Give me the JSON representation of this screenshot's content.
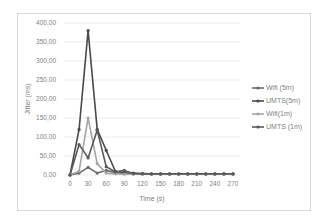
{
  "chart_data": {
    "type": "line",
    "title": "",
    "xlabel": "Time (s)",
    "ylabel": "Jitter (ms)",
    "ylim": [
      0,
      400
    ],
    "xlim": [
      0,
      270
    ],
    "grid": true,
    "legend_position": "right",
    "y_ticks": [
      "0,00",
      "50,00",
      "100,00",
      "150,00",
      "200,00",
      "250,00",
      "300,00",
      "350,00",
      "400,00"
    ],
    "x_ticks": [
      "0",
      "30",
      "60",
      "90",
      "120",
      "150",
      "180",
      "210",
      "240",
      "270"
    ],
    "x": [
      0,
      15,
      30,
      45,
      60,
      75,
      90,
      105,
      120,
      135,
      150,
      165,
      180,
      195,
      210,
      225,
      240,
      255,
      270
    ],
    "series": [
      {
        "name": "Wifi (5m)",
        "color": "#6b6b6b",
        "values": [
          0,
          5,
          20,
          5,
          12,
          6,
          4,
          3,
          3,
          2,
          2,
          2,
          2,
          2,
          2,
          2,
          2,
          2,
          2
        ]
      },
      {
        "name": "UMTS(5m)",
        "color": "#4a4a4a",
        "values": [
          0,
          120,
          380,
          120,
          65,
          10,
          6,
          5,
          4,
          3,
          3,
          3,
          3,
          3,
          3,
          3,
          3,
          3,
          3
        ]
      },
      {
        "name": "Wifi(1m)",
        "color": "#a6a6a6",
        "values": [
          0,
          10,
          150,
          30,
          5,
          3,
          2,
          2,
          2,
          2,
          2,
          2,
          2,
          2,
          2,
          2,
          2,
          2,
          2
        ]
      },
      {
        "name": "UMTS (1m)",
        "color": "#595959",
        "values": [
          0,
          80,
          45,
          118,
          22,
          8,
          12,
          4,
          3,
          3,
          3,
          3,
          3,
          3,
          3,
          3,
          3,
          3,
          3
        ]
      }
    ]
  },
  "legend": {
    "items": [
      "Wifi (5m)",
      "UMTS(5m)",
      "Wifi(1m)",
      "UMTS (1m)"
    ]
  },
  "axes": {
    "x_title": "Time (s)",
    "y_title": "Jitter (ms)"
  }
}
